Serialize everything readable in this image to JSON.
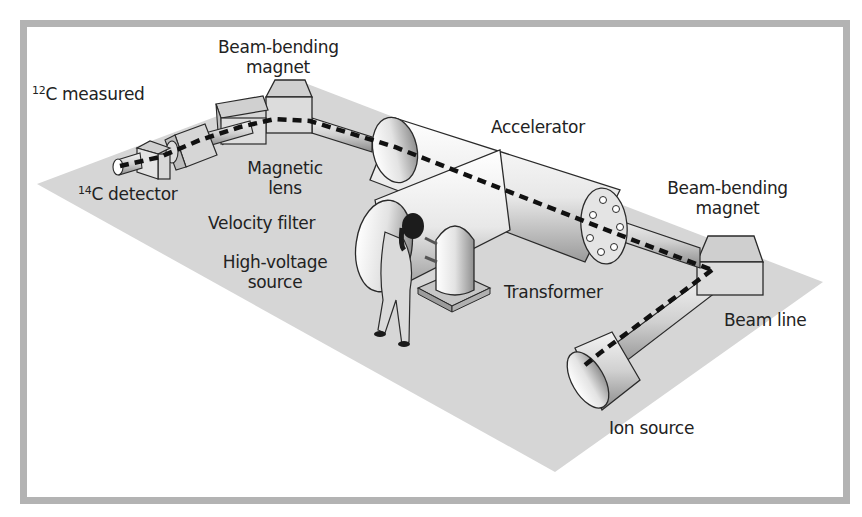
{
  "diagram": {
    "colors": {
      "frame": "#b3b3b3",
      "floor": "#d4d4d4",
      "outline": "#2a2a2a",
      "beam": "#111111",
      "component_fill": "#e6e6e6",
      "label": "#222222"
    },
    "labels": {
      "c12_measured": {
        "sup": "12",
        "text": "C measured"
      },
      "beam_bending_magnet_left": {
        "line1": "Beam-bending",
        "line2": "magnet"
      },
      "c14_detector": {
        "sup": "14",
        "text": "C detector"
      },
      "magnetic_lens": {
        "line1": "Magnetic",
        "line2": "lens"
      },
      "velocity_filter": "Velocity filter",
      "high_voltage_source": {
        "line1": "High-voltage",
        "line2": "source"
      },
      "accelerator": "Accelerator",
      "beam_bending_magnet_right": {
        "line1": "Beam-bending",
        "line2": "magnet"
      },
      "transformer": "Transformer",
      "beam_line": "Beam line",
      "ion_source": "Ion source"
    },
    "components": [
      "ion-source",
      "beam-line",
      "beam-bending-magnet-right",
      "accelerator",
      "high-voltage-source",
      "transformer",
      "beam-bending-magnet-left",
      "magnetic-lens",
      "velocity-filter",
      "c14-detector",
      "operator"
    ]
  }
}
